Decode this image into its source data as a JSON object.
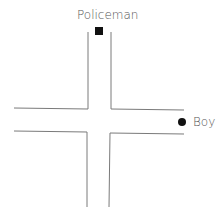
{
  "diagram": {
    "type": "crossroads",
    "labels": {
      "policeman": "Policeman",
      "boy": "Boy"
    },
    "markers": {
      "policeman": {
        "shape": "square",
        "color": "#111111"
      },
      "boy": {
        "shape": "circle",
        "color": "#111111"
      }
    },
    "road_line_color": "#7a7a7a"
  }
}
